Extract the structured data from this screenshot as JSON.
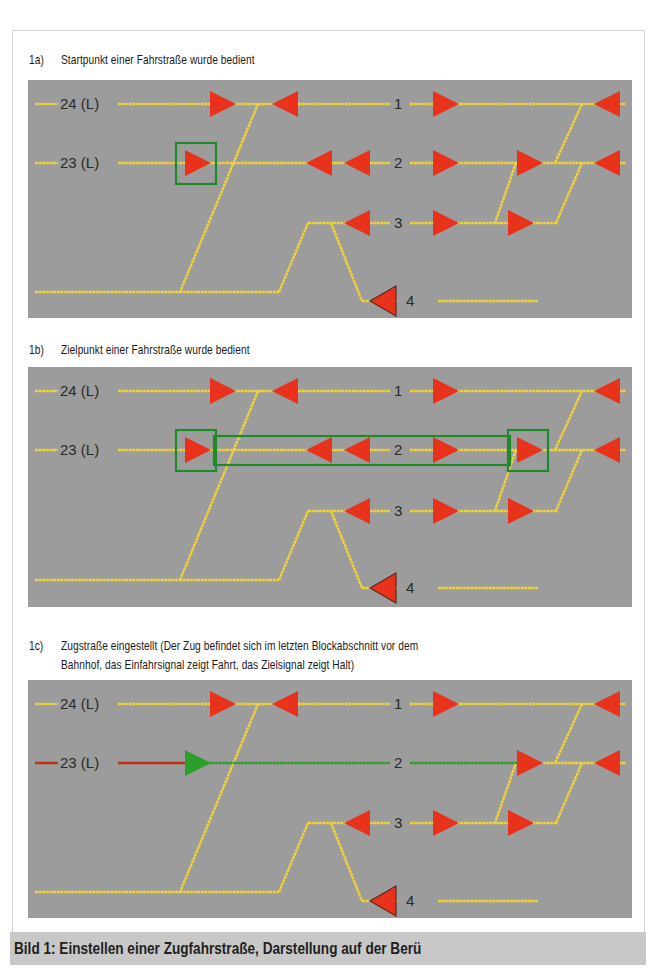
{
  "figure": {
    "caption": "Bild 1:  Einstellen einer Zugfahrstraße, Darstellung auf der Berü"
  },
  "colors": {
    "panel_bg": "#9c9c9c",
    "track": "#f0d23a",
    "signal_halt": "#e8321c",
    "signal_fahrt": "#2aa02a",
    "selection_box": "#1f8a2a",
    "route_set": "#2f9a2f",
    "approach_occupied": "#c0301c"
  },
  "track_labels": {
    "t24": "24 (L)",
    "t23": "23 (L)",
    "t1": "1",
    "t2": "2",
    "t3": "3",
    "t4": "4"
  },
  "sections": [
    {
      "id": "1a",
      "number": "1a)",
      "title": "Startpunkt einer Fahrstraße wurde bedient",
      "title_line2": ""
    },
    {
      "id": "1b",
      "number": "1b)",
      "title": "Zielpunkt einer Fahrstraße wurde bedient",
      "title_line2": ""
    },
    {
      "id": "1c",
      "number": "1c)",
      "title": "Zugstraße eingestellt (Der Zug befindet sich im letzten Blockabschnitt vor dem",
      "title_line2": "Bahnhof, das Einfahrsignal zeigt Fahrt, das Zielsignal zeigt Halt)"
    }
  ],
  "legend_states": {
    "start_selected": "Startpunkt markiert (grüner Rahmen)",
    "target_selected": "Zielpunkt markiert (grüner Rahmen)",
    "route_set": "Fahrstraße grün ausgeleuchtet",
    "entry_signal": "Fahrt",
    "target_signal": "Halt"
  }
}
